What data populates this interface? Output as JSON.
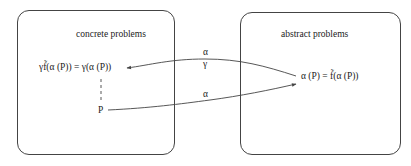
{
  "diagram": {
    "left_box": {
      "title": "concrete problems",
      "formula": "γf̃(α (P)) = γ(α (P))",
      "source_node": "P"
    },
    "right_box": {
      "title": "abstract problems",
      "formula": "α (P) = f̃(α (P))"
    },
    "edges": [
      {
        "from": "abstract formula",
        "to": "concrete formula",
        "label_top": "α",
        "label_bottom": "γ"
      },
      {
        "from": "P",
        "to": "abstract formula",
        "label_top": "α"
      }
    ],
    "colors": {
      "stroke": "#444444",
      "text": "#222222",
      "background": "#ffffff"
    }
  }
}
